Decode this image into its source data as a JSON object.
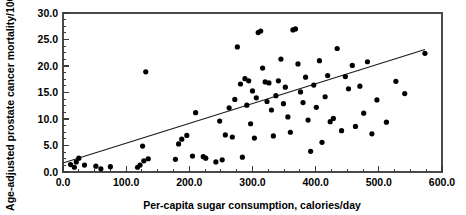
{
  "chart_data": {
    "type": "scatter",
    "title": "",
    "xlabel": "Per-capita sugar consumption, calories/day",
    "ylabel": "Age-adjusted prostate cancer mortality/100,000",
    "xlim": [
      0,
      600
    ],
    "ylim": [
      0,
      30
    ],
    "xticks": [
      0,
      100,
      200,
      300,
      400,
      500,
      600
    ],
    "xticklabels": [
      "0.0",
      "100.0",
      "200.0",
      "300.0",
      "400.0",
      "500.0",
      "600.0"
    ],
    "xminor_step": 25,
    "yticks": [
      0,
      5,
      10,
      15,
      20,
      25,
      30
    ],
    "yticklabels": [
      "0.0",
      "5.0",
      "10.0",
      "15.0",
      "20.0",
      "25.0",
      "30.0"
    ],
    "yminor_step": 1.25,
    "grid": false,
    "legend": null,
    "marker": {
      "shape": "circle",
      "color": "#000000",
      "size_px": 2.6
    },
    "trendline": {
      "type": "linear-fit",
      "color": "#1a1a1a",
      "x_start": 0,
      "y_start": 1.7,
      "x_end": 573,
      "y_end": 23.1
    },
    "points": [
      [
        12,
        1.4
      ],
      [
        18,
        0.9
      ],
      [
        21,
        1.9
      ],
      [
        25,
        2.6
      ],
      [
        34,
        1.3
      ],
      [
        52,
        1.1
      ],
      [
        60,
        0.6
      ],
      [
        75,
        1.0
      ],
      [
        118,
        0.9
      ],
      [
        122,
        1.3
      ],
      [
        126,
        4.9
      ],
      [
        128,
        2.1
      ],
      [
        131,
        18.9
      ],
      [
        135,
        2.5
      ],
      [
        178,
        2.4
      ],
      [
        183,
        5.3
      ],
      [
        188,
        6.2
      ],
      [
        196,
        6.9
      ],
      [
        205,
        3.0
      ],
      [
        210,
        11.2
      ],
      [
        222,
        2.9
      ],
      [
        226,
        2.6
      ],
      [
        242,
        1.9
      ],
      [
        248,
        9.6
      ],
      [
        252,
        2.3
      ],
      [
        257,
        7.0
      ],
      [
        263,
        12.1
      ],
      [
        268,
        6.6
      ],
      [
        272,
        13.7
      ],
      [
        276,
        23.6
      ],
      [
        281,
        16.6
      ],
      [
        284,
        2.8
      ],
      [
        288,
        17.6
      ],
      [
        291,
        12.6
      ],
      [
        294,
        17.2
      ],
      [
        297,
        9.1
      ],
      [
        300,
        15.3
      ],
      [
        303,
        6.4
      ],
      [
        306,
        14.0
      ],
      [
        309,
        26.3
      ],
      [
        313,
        26.6
      ],
      [
        316,
        19.6
      ],
      [
        320,
        17.0
      ],
      [
        323,
        13.3
      ],
      [
        326,
        16.8
      ],
      [
        330,
        11.7
      ],
      [
        333,
        6.8
      ],
      [
        337,
        14.4
      ],
      [
        341,
        17.2
      ],
      [
        345,
        21.3
      ],
      [
        349,
        12.9
      ],
      [
        352,
        16.0
      ],
      [
        356,
        10.4
      ],
      [
        360,
        7.5
      ],
      [
        364,
        26.8
      ],
      [
        368,
        27.0
      ],
      [
        372,
        20.4
      ],
      [
        376,
        15.1
      ],
      [
        380,
        13.1
      ],
      [
        384,
        17.9
      ],
      [
        388,
        9.8
      ],
      [
        392,
        3.9
      ],
      [
        397,
        16.4
      ],
      [
        401,
        12.2
      ],
      [
        406,
        21.0
      ],
      [
        410,
        5.6
      ],
      [
        415,
        14.2
      ],
      [
        419,
        18.2
      ],
      [
        423,
        9.5
      ],
      [
        428,
        10.1
      ],
      [
        434,
        23.3
      ],
      [
        441,
        7.8
      ],
      [
        447,
        18.0
      ],
      [
        452,
        15.7
      ],
      [
        458,
        20.1
      ],
      [
        463,
        8.6
      ],
      [
        470,
        16.2
      ],
      [
        476,
        11.1
      ],
      [
        482,
        20.8
      ],
      [
        489,
        7.2
      ],
      [
        497,
        13.6
      ],
      [
        512,
        9.4
      ],
      [
        527,
        17.1
      ],
      [
        541,
        14.8
      ],
      [
        573,
        22.4
      ]
    ]
  },
  "axes": {
    "left_px": 63,
    "right_px": 442,
    "top_px": 13,
    "bottom_px": 172
  }
}
